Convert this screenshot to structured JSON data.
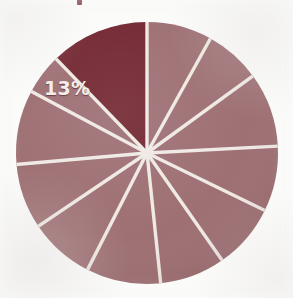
{
  "figure": {
    "title_fragment": "",
    "background_color": "#fbfbfa",
    "label_color": "#f2eeea"
  },
  "labels": {
    "highlight_label": "13%"
  },
  "chart_data": {
    "type": "pie",
    "title": "",
    "subtitle": "",
    "xlabel": "",
    "ylabel": "",
    "legend_position": "none",
    "grid": false,
    "center_px": [
      147,
      153
    ],
    "radius_px": 131,
    "start_angle_deg": 90,
    "direction": "clockwise",
    "slice_colors": {
      "default": "#9c6d71",
      "highlight": "#71242f",
      "separator": "#efe9e4"
    },
    "categories": [
      "Slice 1",
      "Slice 2",
      "Slice 3",
      "Slice 4",
      "Slice 5",
      "Slice 6",
      "Slice 7",
      "Slice 8",
      "Slice 9",
      "Slice 10",
      "Slice 11",
      "Slice 12"
    ],
    "values": [
      8,
      7,
      9,
      8,
      8,
      8,
      9,
      8,
      8,
      9,
      5,
      13
    ],
    "data_labels": [
      "",
      "",
      "",
      "",
      "",
      "",
      "",
      "",
      "",
      "",
      "",
      "13%"
    ],
    "highlighted_index": 11,
    "slices": [
      {
        "label": "Slice 1",
        "value": 8,
        "start_deg": 90,
        "end_deg": 61,
        "color": "#9c6d71",
        "highlighted": false,
        "data_label": ""
      },
      {
        "label": "Slice 2",
        "value": 7,
        "start_deg": 61,
        "end_deg": 36,
        "color": "#9c6d71",
        "highlighted": false,
        "data_label": ""
      },
      {
        "label": "Slice 3",
        "value": 9,
        "start_deg": 36,
        "end_deg": 3,
        "color": "#9c6d71",
        "highlighted": false,
        "data_label": ""
      },
      {
        "label": "Slice 4",
        "value": 8,
        "start_deg": 3,
        "end_deg": -26,
        "color": "#9c6d71",
        "highlighted": false,
        "data_label": ""
      },
      {
        "label": "Slice 5",
        "value": 8,
        "start_deg": -26,
        "end_deg": -55,
        "color": "#9c6d71",
        "highlighted": false,
        "data_label": ""
      },
      {
        "label": "Slice 6",
        "value": 8,
        "start_deg": -55,
        "end_deg": -84,
        "color": "#9c6d71",
        "highlighted": false,
        "data_label": ""
      },
      {
        "label": "Slice 7",
        "value": 9,
        "start_deg": -84,
        "end_deg": -117,
        "color": "#9c6d71",
        "highlighted": false,
        "data_label": ""
      },
      {
        "label": "Slice 8",
        "value": 8,
        "start_deg": -117,
        "end_deg": -146,
        "color": "#9c6d71",
        "highlighted": false,
        "data_label": ""
      },
      {
        "label": "Slice 9",
        "value": 8,
        "start_deg": -146,
        "end_deg": -175,
        "color": "#9c6d71",
        "highlighted": false,
        "data_label": ""
      },
      {
        "label": "Slice 10",
        "value": 9,
        "start_deg": -175,
        "end_deg": -208,
        "color": "#9c6d71",
        "highlighted": false,
        "data_label": ""
      },
      {
        "label": "Slice 11",
        "value": 5,
        "start_deg": -208,
        "end_deg": -226,
        "color": "#9c6d71",
        "highlighted": false,
        "data_label": ""
      },
      {
        "label": "Slice 12",
        "value": 13,
        "start_deg": -226,
        "end_deg": -270,
        "color": "#71242f",
        "highlighted": true,
        "data_label": "13%"
      }
    ]
  }
}
